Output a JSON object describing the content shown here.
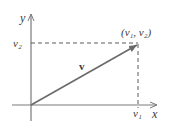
{
  "diagram": {
    "type": "vector-components",
    "axes": {
      "x_label": "x",
      "y_label": "y"
    },
    "vector": {
      "label": "v",
      "endpoint_label": "(v₁, v₂)",
      "x_component_label": "v₁",
      "y_component_label": "v₂"
    },
    "colors": {
      "axis": "#7a7a7a",
      "vector": "#6a6a6a",
      "dashed": "#5a5a5a",
      "text": "#3a3a3a"
    }
  }
}
